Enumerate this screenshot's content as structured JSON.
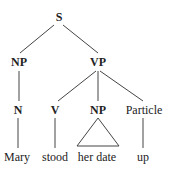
{
  "tree": {
    "nodes": [
      {
        "id": "s",
        "label": "S",
        "x": 59,
        "y": 17,
        "type": "category"
      },
      {
        "id": "np1",
        "label": "NP",
        "x": 19,
        "y": 62,
        "type": "category"
      },
      {
        "id": "vp",
        "label": "VP",
        "x": 98,
        "y": 62,
        "type": "category"
      },
      {
        "id": "n",
        "label": "N",
        "x": 18,
        "y": 110,
        "type": "category"
      },
      {
        "id": "v",
        "label": "V",
        "x": 55,
        "y": 110,
        "type": "category"
      },
      {
        "id": "np2",
        "label": "NP",
        "x": 98,
        "y": 110,
        "type": "category"
      },
      {
        "id": "particle",
        "label": "Particle",
        "x": 144,
        "y": 110,
        "type": "category"
      },
      {
        "id": "mary",
        "label": "Mary",
        "x": 17,
        "y": 157,
        "type": "word"
      },
      {
        "id": "stood",
        "label": "stood",
        "x": 55,
        "y": 157,
        "type": "word"
      },
      {
        "id": "herdate",
        "label": "her date",
        "x": 97,
        "y": 157,
        "type": "word"
      },
      {
        "id": "up",
        "label": "up",
        "x": 143,
        "y": 157,
        "type": "word"
      }
    ]
  }
}
